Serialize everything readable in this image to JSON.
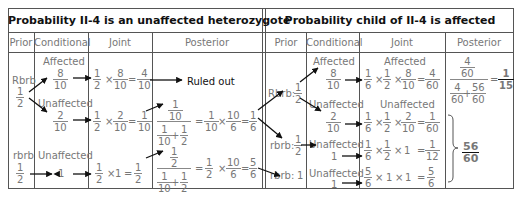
{
  "left_table": {
    "title": "Probability II-4 is an unaffected heterozygote",
    "headers": [
      "Prior",
      "Conditional",
      "Joint",
      "Posterior"
    ],
    "rows": [
      {
        "genotype": "Rbrb",
        "prior": {
          "n": "1",
          "d": "2"
        },
        "branches": [
          {
            "conditional_label": "Affected",
            "conditional": {
              "n": "8",
              "d": "10"
            },
            "joint_terms": [
              {
                "n": "1",
                "d": "2"
              },
              {
                "n": "8",
                "d": "10"
              }
            ],
            "joint_result": {
              "n": "4",
              "d": "10"
            },
            "posterior_note": "Ruled out"
          },
          {
            "conditional_label": "Unaffected",
            "conditional": {
              "n": "2",
              "d": "10"
            },
            "joint_terms": [
              {
                "n": "1",
                "d": "2"
              },
              {
                "n": "2",
                "d": "10"
              }
            ],
            "joint_result": {
              "n": "1",
              "d": "10"
            },
            "posterior_numerator": {
              "n": "1",
              "d": "10"
            },
            "posterior_denominator_terms": [
              {
                "n": "1",
                "d": "10"
              },
              {
                "n": "1",
                "d": "2"
              }
            ],
            "posterior_mult": [
              {
                "n": "1",
                "d": "10"
              },
              {
                "n": "10",
                "d": "6"
              }
            ],
            "posterior_result": {
              "n": "1",
              "d": "6"
            }
          }
        ]
      },
      {
        "genotype": "rbrb",
        "prior": {
          "n": "1",
          "d": "2"
        },
        "branches": [
          {
            "conditional_label": "Unaffected",
            "conditional_value": "1",
            "joint_terms": [
              {
                "n": "1",
                "d": "2"
              }
            ],
            "joint_times": "1",
            "joint_result": {
              "n": "1",
              "d": "2"
            },
            "posterior_numerator": {
              "n": "1",
              "d": "2"
            },
            "posterior_denominator_terms": [
              {
                "n": "1",
                "d": "10"
              },
              {
                "n": "1",
                "d": "2"
              }
            ],
            "posterior_mult": [
              {
                "n": "1",
                "d": "2"
              },
              {
                "n": "10",
                "d": "6"
              }
            ],
            "posterior_result": {
              "n": "5",
              "d": "6"
            }
          }
        ]
      }
    ]
  },
  "right_table": {
    "title": "Probability child of II-4 is affected",
    "headers": [
      "Prior",
      "Conditional",
      "Joint",
      "Posterior"
    ],
    "rows": [
      {
        "label": "Rbrb:",
        "prior": {
          "n": "1",
          "d": "2"
        },
        "branches": [
          {
            "conditional_label": "Affected",
            "conditional": {
              "n": "8",
              "d": "10"
            },
            "joint_label": "Affected",
            "joint_terms": [
              {
                "n": "1",
                "d": "6"
              },
              {
                "n": "1",
                "d": "2"
              },
              {
                "n": "8",
                "d": "10"
              }
            ],
            "joint_result": {
              "n": "4",
              "d": "60"
            }
          },
          {
            "conditional_label": "Unaffected",
            "conditional": {
              "n": "2",
              "d": "10"
            },
            "joint_label": "Unaffected",
            "joint_terms": [
              {
                "n": "1",
                "d": "6"
              },
              {
                "n": "1",
                "d": "2"
              },
              {
                "n": "2",
                "d": "10"
              }
            ],
            "joint_result": {
              "n": "1",
              "d": "60"
            }
          }
        ]
      },
      {
        "label": "rbrb:",
        "prior": {
          "n": "1",
          "d": "2"
        },
        "branches": [
          {
            "conditional_label": "Unaffected",
            "conditional_value": "1",
            "joint_terms": [
              {
                "n": "1",
                "d": "6"
              },
              {
                "n": "1",
                "d": "2"
              }
            ],
            "joint_times": "1",
            "joint_result": {
              "n": "1",
              "d": "12"
            }
          }
        ]
      },
      {
        "label": "rbrb:",
        "prior_value": "1",
        "branches": [
          {
            "conditional_label": "Unaffected",
            "conditional_value": "1",
            "joint_terms": [
              {
                "n": "5",
                "d": "6"
              }
            ],
            "joint_times": [
              "1",
              "1"
            ],
            "joint_result": {
              "n": "5",
              "d": "6"
            }
          }
        ]
      }
    ],
    "posterior_affected": {
      "numerator": {
        "n": "4",
        "d": "60"
      },
      "denominator_terms": [
        {
          "n": "4",
          "d": "60"
        },
        {
          "n": "56",
          "d": "60"
        }
      ],
      "result": {
        "n": "1",
        "d": "15"
      }
    },
    "posterior_unaffected": {
      "n": "56",
      "d": "60"
    }
  },
  "symbols": {
    "times": "×",
    "equals": "=",
    "plus": "+"
  }
}
